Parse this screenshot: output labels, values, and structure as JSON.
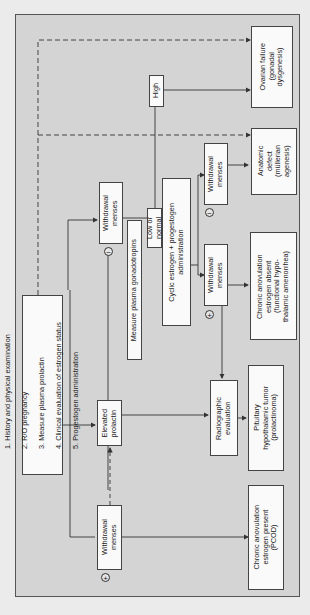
{
  "orientation": "rotated 90 degrees counter-clockwise",
  "steps": {
    "items": [
      "1. History and physical examination",
      "2. R/O pregnancy",
      "3. Measure plasma prolactin",
      "4. Clinical evaluation of estrogen status",
      "5. Progestogen administration"
    ]
  },
  "nodes": {
    "withdrawal_pos_main": "Withdrawal\nmenses",
    "elevated_prolactin": "Elevated\nprolactin",
    "withdrawal_neg_main": "Withdrawal\nmenses",
    "measure_gonadotropins": "Measure plasma gonadotropins",
    "high": "High",
    "low_normal": "Low or normal",
    "cyclic_estrogen": "Cyclic estrogen + progestogen\nadministration",
    "withdrawal_neg_cyclic": "Withdrawal\nmenses",
    "withdrawal_pos_cyclic": "Withdrawal\nmenses",
    "radiographic": "Radiographic\nevaluation"
  },
  "outcomes": {
    "ovarian_failure": "Ovarian failure\n(gonadal\ndysgenesis)",
    "anatomic_defect": "Anatomic\ndefect\n(müllerian\nagenesis)",
    "chronic_absent": "Chronic anovulation\nestrogen absent\n(functional hypo-\nthalamic amenorrhea)",
    "pituitary_tumor": "Pituitary\nhypothalamic tumor\n(prolactinoma)",
    "chronic_present": "Chronic anovulation\nestrogen present\n(PCOD)"
  },
  "signs": {
    "plus": "+",
    "minus": "−"
  },
  "colors": {
    "frame_bg": "#d4d4d4",
    "box_bg": "#fafafa",
    "line": "#333333"
  }
}
